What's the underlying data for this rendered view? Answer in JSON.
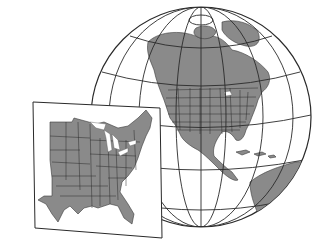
{
  "figure": {
    "globe": {
      "label": "North America globe",
      "land_color": "#8a8a8a",
      "ocean_color": "#ffffff",
      "graticule_color": "#2a2a2a"
    },
    "inset": {
      "label": "Eastern United States inset map",
      "land_color": "#8a8a8a",
      "background_color": "#ffffff",
      "border_color": "#2a2a2a"
    }
  }
}
